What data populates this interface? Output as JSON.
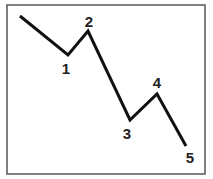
{
  "diagram": {
    "type": "wave-pattern",
    "colors": {
      "line": "#111111",
      "frame": "#555555",
      "background": "#ffffff"
    },
    "points": [
      {
        "id": "start",
        "label": ""
      },
      {
        "id": "p1",
        "label": "1"
      },
      {
        "id": "p2",
        "label": "2"
      },
      {
        "id": "p3",
        "label": "3"
      },
      {
        "id": "p4",
        "label": "4"
      },
      {
        "id": "p5",
        "label": "5"
      }
    ]
  }
}
